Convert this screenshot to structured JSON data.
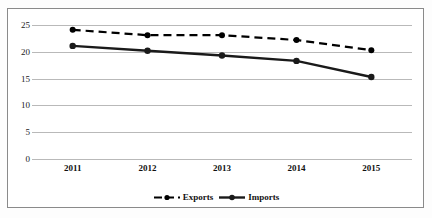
{
  "chart_data": {
    "type": "line",
    "title": "",
    "subtitle": "",
    "xlabel": "",
    "ylabel": "",
    "categories": [
      "2011",
      "2012",
      "2013",
      "2014",
      "2015"
    ],
    "series": [
      {
        "name": "Exports",
        "values": [
          24.1,
          23.1,
          23.1,
          22.2,
          20.3
        ],
        "line_style": "dashed",
        "color": "#000000",
        "marker": "circle"
      },
      {
        "name": "Imports",
        "values": [
          21.1,
          20.2,
          19.3,
          18.3,
          15.3
        ],
        "line_style": "solid",
        "color": "#1a1a1a",
        "marker": "circle"
      }
    ],
    "ylim": [
      0,
      25
    ],
    "yticks": [
      0,
      5,
      10,
      15,
      20,
      25
    ],
    "ytick_labels": [
      "0",
      "5",
      "10",
      "15",
      "20",
      "25"
    ],
    "xtick_labels": [
      "2011",
      "2012",
      "2013",
      "2014",
      "2015"
    ],
    "grid": {
      "horizontal": true,
      "vertical": false,
      "color": "#b9b9b9"
    },
    "legend": {
      "position": "bottom",
      "entries": [
        "Exports",
        "Imports"
      ]
    },
    "frame": {
      "border_color": "#8a8a8a",
      "background": "#ffffff"
    }
  },
  "legend": {
    "entries": [
      {
        "label": "Exports",
        "style": "dashed"
      },
      {
        "label": "Imports",
        "style": "solid"
      }
    ]
  }
}
